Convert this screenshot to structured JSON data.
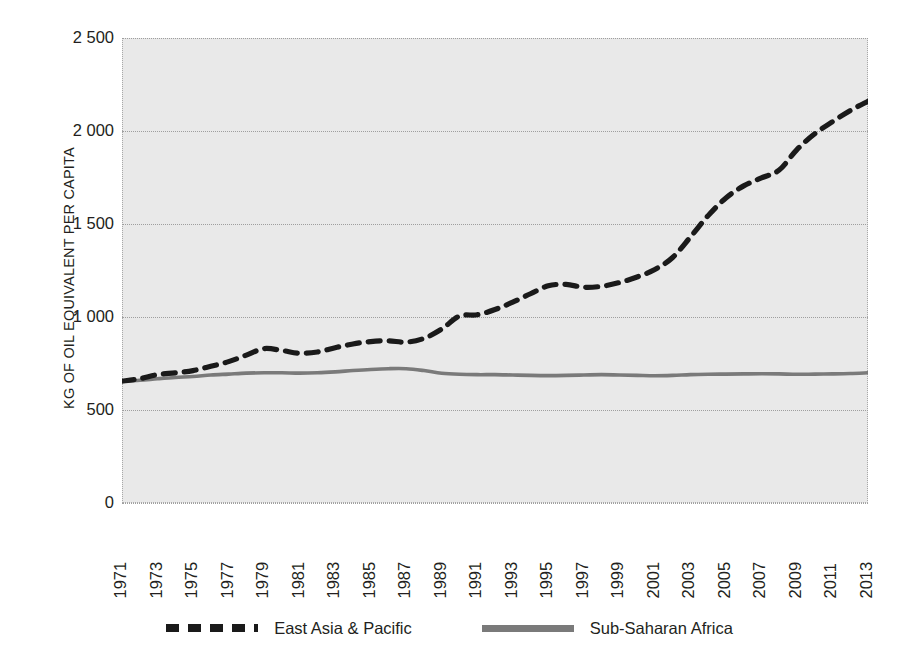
{
  "chart_data": {
    "type": "line",
    "title": "",
    "subtitle": "",
    "xlabel": "",
    "ylabel": "KG OF OIL EQUIVALENT PER CAPITA",
    "xlim": [
      1971,
      2013
    ],
    "ylim": [
      0,
      2500
    ],
    "yticks": [
      0,
      500,
      1000,
      1500,
      2000,
      2500
    ],
    "ytick_labels": [
      "0",
      "500",
      "1 000",
      "1 500",
      "2 000",
      "2 500"
    ],
    "x": [
      1971,
      1972,
      1973,
      1974,
      1975,
      1976,
      1977,
      1978,
      1979,
      1980,
      1981,
      1982,
      1983,
      1984,
      1985,
      1986,
      1987,
      1988,
      1989,
      1990,
      1991,
      1992,
      1993,
      1994,
      1995,
      1996,
      1997,
      1998,
      1999,
      2000,
      2001,
      2002,
      2003,
      2004,
      2005,
      2006,
      2007,
      2008,
      2009,
      2010,
      2011,
      2012,
      2013
    ],
    "xtick_labels": [
      "1971",
      "1973",
      "1975",
      "1977",
      "1979",
      "1981",
      "1983",
      "1985",
      "1987",
      "1989",
      "1991",
      "1993",
      "1995",
      "1997",
      "1999",
      "2001",
      "2003",
      "2005",
      "2007",
      "2009",
      "2011",
      "2013"
    ],
    "grid": true,
    "grid_axis": "y",
    "legend_position": "bottom",
    "series": [
      {
        "name": "East Asia & Pacific",
        "color": "#1a1a1a",
        "style": "dashed",
        "values": [
          655,
          668,
          690,
          700,
          712,
          735,
          760,
          795,
          830,
          820,
          805,
          812,
          835,
          855,
          868,
          872,
          865,
          885,
          935,
          1005,
          1012,
          1040,
          1080,
          1125,
          1168,
          1175,
          1160,
          1165,
          1185,
          1215,
          1255,
          1320,
          1430,
          1545,
          1640,
          1705,
          1748,
          1790,
          1900,
          1985,
          2050,
          2110,
          2160
        ]
      },
      {
        "name": "Sub-Saharan Africa",
        "color": "#7a7a7a",
        "style": "solid",
        "values": [
          655,
          660,
          668,
          675,
          680,
          688,
          693,
          698,
          700,
          700,
          698,
          700,
          705,
          712,
          718,
          722,
          722,
          712,
          698,
          692,
          690,
          690,
          688,
          686,
          685,
          686,
          688,
          690,
          688,
          686,
          684,
          686,
          690,
          692,
          693,
          694,
          695,
          694,
          692,
          693,
          694,
          696,
          700
        ]
      }
    ]
  },
  "legend": {
    "items": [
      {
        "label": "East Asia & Pacific",
        "style": "dashed"
      },
      {
        "label": "Sub-Saharan Africa",
        "style": "solid"
      }
    ]
  },
  "colors": {
    "series_east_asia": "#1a1a1a",
    "series_subsaharan": "#7a7a7a",
    "plot_background": "#e9e9e9",
    "gridline": "#9e9e9e",
    "text": "#231f20"
  }
}
